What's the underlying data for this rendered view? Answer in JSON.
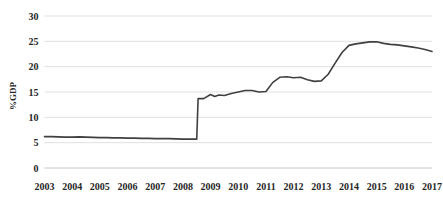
{
  "chart_data": {
    "type": "line",
    "title": "",
    "subtitle": "",
    "xlabel": "",
    "ylabel": "%GDP",
    "xlim": [
      2003,
      2017
    ],
    "ylim": [
      0,
      30
    ],
    "grid": true,
    "legend": null,
    "y_ticks": [
      "0",
      "5",
      "10",
      "15",
      "20",
      "25",
      "30"
    ],
    "y_tick_values": [
      0,
      5,
      10,
      15,
      20,
      25,
      30
    ],
    "x_ticks": [
      "2003",
      "2004",
      "2005",
      "2006",
      "2007",
      "2008",
      "2009",
      "2010",
      "2011",
      "2012",
      "2013",
      "2014",
      "2015",
      "2016",
      "2017"
    ],
    "series": [
      {
        "name": "%GDP",
        "color": "#404040",
        "x": [
          2003.0,
          2003.25,
          2003.5,
          2003.75,
          2004.0,
          2004.25,
          2004.5,
          2004.75,
          2005.0,
          2005.25,
          2005.5,
          2005.75,
          2006.0,
          2006.25,
          2006.5,
          2006.75,
          2007.0,
          2007.25,
          2007.5,
          2007.75,
          2008.0,
          2008.25,
          2008.4,
          2008.5,
          2008.55,
          2008.75,
          2009.0,
          2009.15,
          2009.3,
          2009.5,
          2009.75,
          2010.0,
          2010.25,
          2010.5,
          2010.75,
          2011.0,
          2011.25,
          2011.5,
          2011.75,
          2012.0,
          2012.25,
          2012.5,
          2012.75,
          2013.0,
          2013.25,
          2013.5,
          2013.75,
          2014.0,
          2014.25,
          2014.5,
          2014.75,
          2015.0,
          2015.25,
          2015.5,
          2015.75,
          2016.0,
          2016.25,
          2016.5,
          2016.75,
          2017.0
        ],
        "y": [
          6.2,
          6.2,
          6.15,
          6.1,
          6.1,
          6.15,
          6.1,
          6.05,
          6.0,
          6.0,
          5.95,
          5.95,
          5.9,
          5.9,
          5.85,
          5.85,
          5.8,
          5.8,
          5.8,
          5.75,
          5.7,
          5.7,
          5.7,
          5.7,
          13.7,
          13.7,
          14.5,
          14.1,
          14.4,
          14.3,
          14.7,
          15.0,
          15.3,
          15.3,
          15.0,
          15.1,
          16.9,
          17.9,
          18.0,
          17.8,
          17.9,
          17.4,
          17.1,
          17.2,
          18.5,
          20.7,
          22.8,
          24.2,
          24.5,
          24.7,
          24.9,
          24.9,
          24.6,
          24.4,
          24.3,
          24.1,
          23.9,
          23.7,
          23.4,
          23.0
        ]
      }
    ]
  }
}
